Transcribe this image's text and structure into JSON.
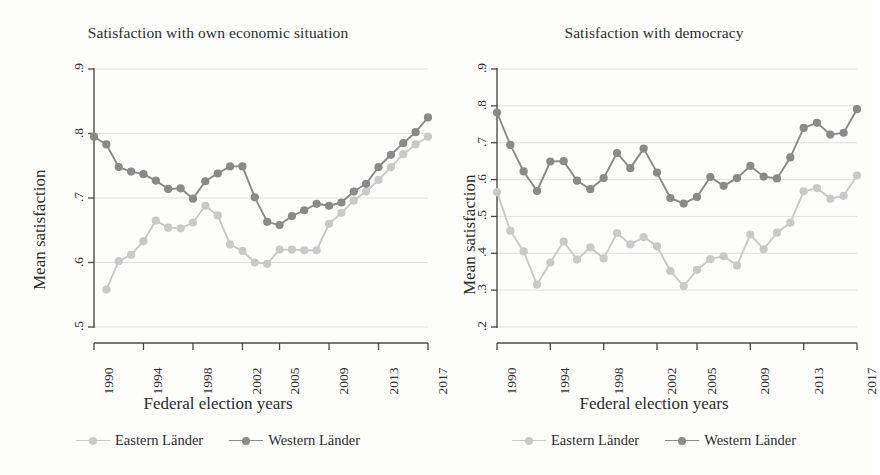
{
  "figure": {
    "background": "#fdfdfc",
    "series_colors": {
      "eastern": "#c9c9c9",
      "western": "#8a8a8a"
    },
    "grid_color": "#d8d8d8",
    "axis_color": "#4a4a4a"
  },
  "panels": [
    {
      "id": "own-economic-situation",
      "title": "Satisfaction with own economic situation",
      "ylabel": "Mean satisfaction",
      "xlabel": "Federal election years"
    },
    {
      "id": "democracy",
      "title": "Satisfaction with democracy",
      "ylabel": "Mean satisfaction",
      "xlabel": "Federal election years"
    }
  ],
  "legend": {
    "items": [
      {
        "label": "Eastern Länder",
        "color": "#c9c9c9",
        "key": "eastern"
      },
      {
        "label": "Western Länder",
        "color": "#8a8a8a",
        "key": "western"
      }
    ]
  },
  "chart_data": [
    {
      "type": "line",
      "title": "Satisfaction with own economic situation",
      "xlabel": "Federal election years",
      "ylabel": "Mean satisfaction",
      "grid": true,
      "legend_position": "bottom",
      "xlim": [
        1990,
        2017
      ],
      "ylim": [
        0.5,
        0.9
      ],
      "yticks": [
        0.5,
        0.6,
        0.7,
        0.8,
        0.9
      ],
      "yticklabels": [
        ".5",
        ".6",
        ".7",
        ".8",
        ".9"
      ],
      "x": [
        1990,
        1991,
        1992,
        1993,
        1994,
        1995,
        1996,
        1997,
        1998,
        1999,
        2000,
        2001,
        2002,
        2003,
        2004,
        2005,
        2006,
        2007,
        2008,
        2009,
        2010,
        2011,
        2012,
        2013,
        2014,
        2015,
        2016,
        2017
      ],
      "xticks": [
        1990,
        1994,
        1998,
        2002,
        2005,
        2009,
        2013,
        2017
      ],
      "xticklabels": [
        "1990",
        "1994",
        "1998",
        "2002",
        "2005",
        "2009",
        "2013",
        "2017"
      ],
      "series": [
        {
          "name": "Eastern Länder",
          "color": "#c9c9c9",
          "values": [
            null,
            0.558,
            0.602,
            0.612,
            0.633,
            0.665,
            0.654,
            0.653,
            0.662,
            0.688,
            0.673,
            0.628,
            0.618,
            0.6,
            0.598,
            0.62,
            0.62,
            0.619,
            0.619,
            0.66,
            0.677,
            0.696,
            0.71,
            0.728,
            0.748,
            0.768,
            0.783,
            0.795
          ]
        },
        {
          "name": "Western Länder",
          "color": "#8a8a8a",
          "values": [
            0.795,
            0.783,
            0.748,
            0.741,
            0.737,
            0.727,
            0.714,
            0.715,
            0.699,
            0.726,
            0.738,
            0.749,
            0.749,
            0.701,
            0.663,
            0.658,
            0.672,
            0.681,
            0.691,
            0.688,
            0.693,
            0.71,
            0.722,
            0.748,
            0.767,
            0.785,
            0.802,
            0.825
          ]
        }
      ]
    },
    {
      "type": "line",
      "title": "Satisfaction with democracy",
      "xlabel": "Federal election years",
      "ylabel": "Mean satisfaction",
      "grid": true,
      "legend_position": "bottom",
      "xlim": [
        1990,
        2017
      ],
      "ylim": [
        0.2,
        0.9
      ],
      "yticks": [
        0.2,
        0.3,
        0.4,
        0.5,
        0.6,
        0.7,
        0.8,
        0.9
      ],
      "yticklabels": [
        ".2",
        ".3",
        ".4",
        ".5",
        ".6",
        ".7",
        ".8",
        ".9"
      ],
      "x": [
        1990,
        1991,
        1992,
        1993,
        1994,
        1995,
        1996,
        1997,
        1998,
        1999,
        2000,
        2001,
        2002,
        2003,
        2004,
        2005,
        2006,
        2007,
        2008,
        2009,
        2010,
        2011,
        2012,
        2013,
        2014,
        2015,
        2016,
        2017
      ],
      "xticks": [
        1990,
        1994,
        1998,
        2002,
        2005,
        2009,
        2013,
        2017
      ],
      "xticklabels": [
        "1990",
        "1994",
        "1998",
        "2002",
        "2005",
        "2009",
        "2013",
        "2017"
      ],
      "series": [
        {
          "name": "Eastern Länder",
          "color": "#c9c9c9",
          "values": [
            0.566,
            0.461,
            0.405,
            0.315,
            0.375,
            0.432,
            0.383,
            0.416,
            0.386,
            0.455,
            0.424,
            0.444,
            0.419,
            0.352,
            0.311,
            0.355,
            0.384,
            0.392,
            0.367,
            0.451,
            0.411,
            0.456,
            0.483,
            0.568,
            0.577,
            0.548,
            0.556,
            0.611
          ]
        },
        {
          "name": "Western Länder",
          "color": "#8a8a8a",
          "values": [
            0.782,
            0.694,
            0.622,
            0.569,
            0.649,
            0.65,
            0.597,
            0.574,
            0.604,
            0.672,
            0.631,
            0.684,
            0.619,
            0.55,
            0.535,
            0.553,
            0.607,
            0.583,
            0.604,
            0.637,
            0.608,
            0.603,
            0.66,
            0.74,
            0.754,
            0.722,
            0.727,
            0.791
          ]
        }
      ]
    }
  ]
}
